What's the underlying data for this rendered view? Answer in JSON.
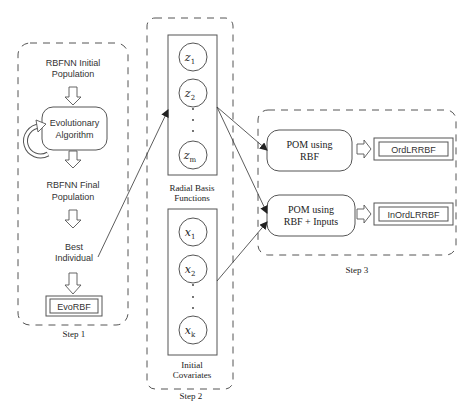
{
  "step1": {
    "label": "Step 1",
    "nodes": {
      "initial_pop_line1": "RBFNN Initial",
      "initial_pop_line2": "Population",
      "ea_line1": "Evolutionary",
      "ea_line2": "Algorithm",
      "final_pop_line1": "RBFNN Final",
      "final_pop_line2": "Population",
      "best_line1": "Best",
      "best_line2": "Individual",
      "output": "EvoRBF"
    }
  },
  "step2": {
    "label": "Step 2",
    "rbf_group": {
      "label_line1": "Radial Basis",
      "label_line2": "Functions",
      "nodes": [
        {
          "base": "z",
          "sub": "1"
        },
        {
          "base": "z",
          "sub": "2"
        },
        {
          "base": "z",
          "sub": "m"
        }
      ]
    },
    "cov_group": {
      "label_line1": "Initial",
      "label_line2": "Covariates",
      "nodes": [
        {
          "base": "x",
          "sub": "1"
        },
        {
          "base": "x",
          "sub": "2"
        },
        {
          "base": "x",
          "sub": "k"
        }
      ]
    }
  },
  "step3": {
    "label": "Step 3",
    "model1_line1": "POM using",
    "model1_line2": "RBF",
    "model1_output": "OrdLRRBF",
    "model2_line1": "POM using",
    "model2_line2": "RBF + Inputs",
    "model2_output": "InOrdLRRBF"
  }
}
